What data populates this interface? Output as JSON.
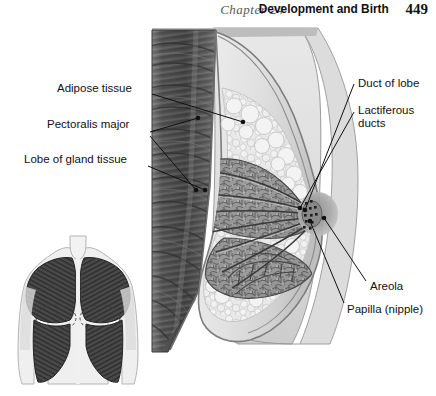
{
  "header": {
    "chapter": "Chapter 24",
    "title": "Development and Birth",
    "page_number": "449"
  },
  "figure": {
    "labels": {
      "adipose_tissue": "Adipose tissue",
      "pectoralis_major": "Pectoralis major",
      "lobe_of_gland_tissue": "Lobe of gland tissue",
      "duct_of_lobe": "Duct of lobe",
      "lactiferous_ducts_line1": "Lactiferous",
      "lactiferous_ducts_line2": "ducts",
      "areola": "Areola",
      "papilla": "Papilla (nipple)"
    },
    "inset": {
      "description": "Anterior view of torso showing pectoralis major muscles"
    },
    "colors": {
      "background": "#ffffff",
      "skin_light": "#e9e9e9",
      "breast_fill": "#dedede",
      "chest_wall": "#e4e4e4",
      "muscle_dark": "#4a4a4a",
      "muscle_mid": "#6f6f6f",
      "muscle_light": "#9a9a9a",
      "adipose": "#e6e6e6",
      "gland": "#8d8d8d",
      "areola": "#a8a8a8",
      "nipple": "#8a8a8a",
      "line": "#1a1a1a",
      "text": "#111111"
    }
  }
}
